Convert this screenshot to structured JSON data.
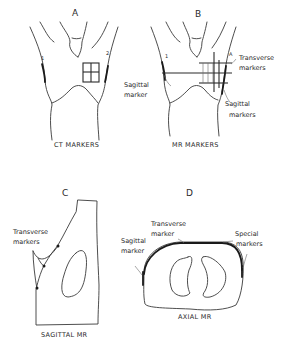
{
  "figure": {
    "panels": [
      {
        "id": "A",
        "letter": "A",
        "caption": "CT MARKERS",
        "small_labels": [
          "1",
          "2"
        ]
      },
      {
        "id": "B",
        "letter": "B",
        "caption": "MR MARKERS",
        "small_labels": [
          "1",
          "A"
        ],
        "annotations": [
          {
            "line1": "Transverse",
            "line2": "markers"
          },
          {
            "line1": "Sagittal",
            "line2": "marker"
          },
          {
            "line1": "Sagittal",
            "line2": "markers"
          }
        ]
      },
      {
        "id": "C",
        "letter": "C",
        "caption": "SAGITTAL MR",
        "annotations": [
          {
            "line1": "Transverse",
            "line2": "markers"
          }
        ]
      },
      {
        "id": "D",
        "letter": "D",
        "caption": "AXIAL MR",
        "annotations": [
          {
            "line1": "Transverse",
            "line2": "marker"
          },
          {
            "line1": "Sagittal",
            "line2": "marker"
          },
          {
            "line1": "Special",
            "line2": "markers"
          }
        ]
      }
    ]
  },
  "colors": {
    "background": "#ffffff",
    "ink": "#2a2a2a"
  }
}
